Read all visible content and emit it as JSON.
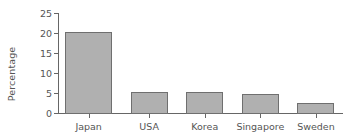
{
  "chart_data": {
    "type": "bar",
    "title": "",
    "xlabel": "",
    "ylabel": "Percentage",
    "categories": [
      "Japan",
      "USA",
      "Korea",
      "Singapore",
      "Sweden"
    ],
    "values": [
      20.2,
      5.2,
      5.3,
      4.7,
      2.4
    ],
    "ylim": [
      0,
      25
    ],
    "yticks": [
      0,
      5,
      10,
      15,
      20,
      25
    ],
    "ytick_labels": [
      "0",
      "5",
      "10",
      "15",
      "20",
      "25"
    ],
    "grid": false,
    "legend": null,
    "series": [
      {
        "name": "Percentage",
        "values": [
          20.2,
          5.2,
          5.3,
          4.7,
          2.4
        ]
      }
    ],
    "bar_layout": [
      {
        "category": "Japan",
        "value": 20.2,
        "left_pct": 2.5,
        "width_pct": 16.5,
        "tick_pct": 10.75
      },
      {
        "category": "USA",
        "value": 5.2,
        "left_pct": 25.5,
        "width_pct": 13.0,
        "tick_pct": 32.0
      },
      {
        "category": "Korea",
        "value": 5.3,
        "left_pct": 45.0,
        "width_pct": 13.0,
        "tick_pct": 51.5
      },
      {
        "category": "Singapore",
        "value": 4.7,
        "left_pct": 64.5,
        "width_pct": 13.0,
        "tick_pct": 71.0
      },
      {
        "category": "Sweden",
        "value": 2.4,
        "left_pct": 84.0,
        "width_pct": 13.0,
        "tick_pct": 90.5
      }
    ],
    "colors": {
      "bar_fill": "#b0b0b0",
      "bar_edge": "#6f6f6f",
      "axis": "#666666",
      "text": "#555555",
      "background": "#ffffff"
    }
  }
}
